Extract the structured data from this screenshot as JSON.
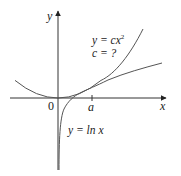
{
  "figure": {
    "axes": {
      "x_label": "x",
      "y_label": "y",
      "origin_label": "0",
      "tick_label": "a"
    },
    "curves": [
      {
        "name": "parabola",
        "equation_lhs": "y = c",
        "equation_var": "x",
        "equation_exp": "2",
        "constant_note": "c = ?"
      },
      {
        "name": "logarithm",
        "equation": "y = ln x"
      }
    ],
    "colors": {
      "axis": "#333333",
      "curve": "#555555",
      "text": "#222222"
    }
  }
}
